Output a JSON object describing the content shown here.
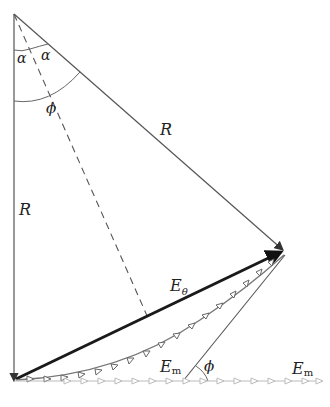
{
  "labels": {
    "alpha_left": "α",
    "alpha_right": "α",
    "phi_top": "ϕ",
    "R_slant": "R",
    "R_vertical": "R",
    "E_theta_main": "E",
    "E_theta_sub": "θ",
    "E_m_chain_main": "E",
    "E_m_chain_sub": "m",
    "phi_bottom": "ϕ",
    "E_m_line_main": "E",
    "E_m_line_sub": "m"
  },
  "colors": {
    "thin_line": "#555555",
    "thick_line": "#1a1a1a",
    "chain_dark": "#777777",
    "chain_light": "#bbbbbb"
  }
}
